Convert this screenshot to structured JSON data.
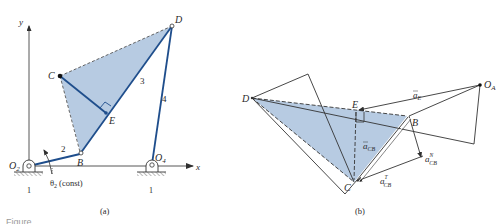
{
  "figure_a": {
    "axis_x_label": "x",
    "axis_y_label": "y",
    "points": {
      "O2": "O",
      "O2_sub": "2",
      "O4": "O",
      "O4_sub": "4",
      "B": "B",
      "C": "C",
      "D": "D",
      "E": "E"
    },
    "links": {
      "ground_left": "1",
      "ground_right": "1",
      "crank": "2",
      "coupler": "3",
      "rocker": "4"
    },
    "theta_label": "θ",
    "theta_sub": "2",
    "theta_note": "(const)",
    "caption": "(a)",
    "colors": {
      "link": "#1f4e8c",
      "shade": "#b7cbe2",
      "line": "#3a3a3a"
    }
  },
  "figure_b": {
    "points": {
      "D": "D",
      "E": "E",
      "B": "B",
      "C": "C",
      "OA": "O",
      "OA_sub": "A"
    },
    "vectors": {
      "a_E": "a",
      "a_E_sub": "E",
      "a_CB": "a",
      "a_CB_sub": "CB",
      "a_CB_N": "a",
      "a_CB_N_sub": "CB",
      "a_CB_N_sup": "N",
      "a_CB_T": "a",
      "a_CB_T_sub": "CB",
      "a_CB_T_sup": "T"
    },
    "caption": "(b)",
    "colors": {
      "shade": "#b7cbe2",
      "line": "#2f2f2f"
    }
  },
  "figure_caption_cropped": "Figure ..."
}
